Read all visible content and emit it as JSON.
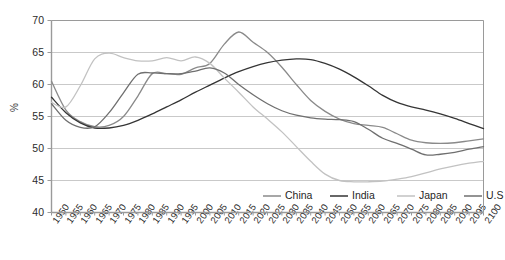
{
  "chart_data": {
    "type": "line",
    "title": "",
    "xlabel": "",
    "ylabel": "%",
    "ylim": [
      40,
      70
    ],
    "yticks": [
      40,
      45,
      50,
      55,
      60,
      65,
      70
    ],
    "grid": true,
    "legend_position": "inside-bottom-right",
    "x": [
      1950,
      1955,
      1960,
      1965,
      1970,
      1975,
      1980,
      1985,
      1990,
      1995,
      2000,
      2005,
      2010,
      2015,
      2020,
      2025,
      2030,
      2035,
      2040,
      2045,
      2050,
      2055,
      2060,
      2065,
      2070,
      2075,
      2080,
      2085,
      2090,
      2095,
      2100
    ],
    "xticks": [
      "1950",
      "1955",
      "1960",
      "1965",
      "1970",
      "1975",
      "1980",
      "1985",
      "1990",
      "1995",
      "2000",
      "2005",
      "2010",
      "2015",
      "2020",
      "2025",
      "2030",
      "2035",
      "2040",
      "2045",
      "2050",
      "2055",
      "2060",
      "2065",
      "2070",
      "2075",
      "2080",
      "2085",
      "2090",
      "2095",
      "2100"
    ],
    "series": [
      {
        "name": "China",
        "color": "#8a8a8a",
        "values": [
          60.5,
          56.0,
          54.2,
          53.4,
          53.6,
          55.0,
          58.2,
          61.7,
          61.7,
          61.6,
          62.6,
          63.3,
          66.3,
          68.2,
          66.6,
          65.0,
          62.7,
          60.0,
          57.5,
          55.8,
          54.6,
          53.9,
          53.6,
          53.3,
          52.3,
          51.3,
          50.9,
          50.8,
          50.9,
          51.2,
          51.5
        ]
      },
      {
        "name": "India",
        "color": "#353535",
        "values": [
          58.0,
          55.6,
          54.0,
          53.2,
          53.2,
          53.6,
          54.4,
          55.4,
          56.5,
          57.6,
          58.8,
          59.9,
          61.0,
          62.0,
          62.8,
          63.4,
          63.8,
          64.0,
          63.9,
          63.3,
          62.4,
          61.2,
          59.8,
          58.3,
          57.2,
          56.5,
          56.0,
          55.4,
          54.7,
          53.9,
          53.1
        ]
      },
      {
        "name": "Japan",
        "color": "#c2c2c2",
        "values": [
          57.2,
          56.5,
          59.8,
          64.0,
          64.9,
          64.2,
          63.7,
          63.7,
          64.2,
          63.7,
          64.3,
          63.3,
          61.0,
          58.8,
          56.5,
          54.6,
          52.6,
          50.3,
          48.0,
          46.0,
          45.0,
          44.8,
          44.8,
          44.9,
          45.2,
          45.6,
          46.2,
          46.8,
          47.3,
          47.7,
          48.0
        ]
      },
      {
        "name": "U.S",
        "color": "#6f6f6f",
        "values": [
          57.0,
          54.4,
          53.3,
          53.4,
          55.6,
          58.7,
          61.6,
          61.8,
          61.7,
          61.7,
          62.1,
          62.6,
          61.8,
          60.0,
          58.4,
          57.0,
          55.9,
          55.2,
          54.8,
          54.6,
          54.5,
          54.2,
          53.0,
          51.6,
          50.8,
          49.9,
          49.0,
          49.1,
          49.4,
          49.9,
          50.3
        ]
      }
    ],
    "legend": [
      {
        "label": "China",
        "color": "#8a8a8a"
      },
      {
        "label": "India",
        "color": "#353535"
      },
      {
        "label": "Japan",
        "color": "#c2c2c2"
      },
      {
        "label": "U.S",
        "color": "#6f6f6f"
      }
    ],
    "colors": {
      "axis": "#9a9a9a",
      "grid": "#c9c9c9",
      "text": "#2b2b2b",
      "plot_background": "#ffffff"
    }
  }
}
